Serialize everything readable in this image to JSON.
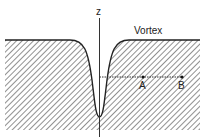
{
  "diagram": {
    "axis_label": "z",
    "surface_label": "Vortex",
    "points": [
      {
        "name": "A"
      },
      {
        "name": "B"
      }
    ],
    "colors": {
      "line": "#222222",
      "hatch": "#555555",
      "background": "#ffffff"
    }
  }
}
